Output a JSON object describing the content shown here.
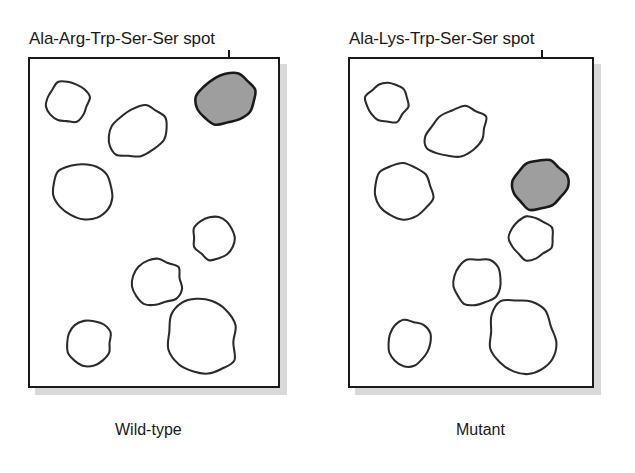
{
  "figure": {
    "title_label_left": "Ala-Arg-Trp-Ser-Ser spot",
    "title_label_right": "Ala-Lys-Trp-Ser-Ser spot",
    "caption_left": "Wild-type",
    "caption_right": "Mutant",
    "background_color": "#ffffff",
    "ink_color": "#1a1a1a",
    "marked_spot_fill": "#9e9e9e",
    "panel_shadow_color": "#d9d9d9"
  },
  "chart_data": {
    "type": "scatter",
    "title": "",
    "xlabel": "",
    "ylabel": "",
    "grid": false,
    "legend": "none",
    "panels": [
      {
        "name": "Wild-type",
        "caption": "Wild-type",
        "annotation": "Ala-Arg-Trp-Ser-Ser spot",
        "box": {
          "x": 28,
          "y": 57,
          "width": 252,
          "height": 331
        },
        "leader_line": {
          "x": 228,
          "y_top": 50,
          "y_bottom": 91
        },
        "spots": [
          {
            "id": "spot-1",
            "cx": 66,
            "cy": 100,
            "rx": 22,
            "ry": 21,
            "rotation": -12,
            "fill": "white",
            "marked": false
          },
          {
            "id": "spot-2",
            "cx": 136,
            "cy": 131,
            "rx": 32,
            "ry": 24,
            "rotation": -28,
            "fill": "white",
            "marked": false
          },
          {
            "id": "spot-3",
            "cx": 228,
            "cy": 97,
            "rx": 30,
            "ry": 26,
            "rotation": -18,
            "fill": "gray",
            "marked": true
          },
          {
            "id": "spot-4",
            "cx": 82,
            "cy": 190,
            "rx": 31,
            "ry": 28,
            "rotation": 14,
            "fill": "white",
            "marked": false
          },
          {
            "id": "spot-5",
            "cx": 215,
            "cy": 238,
            "rx": 22,
            "ry": 22,
            "rotation": 0,
            "fill": "white",
            "marked": false
          },
          {
            "id": "spot-6",
            "cx": 157,
            "cy": 283,
            "rx": 25,
            "ry": 24,
            "rotation": -10,
            "fill": "white",
            "marked": false
          },
          {
            "id": "spot-7",
            "cx": 88,
            "cy": 345,
            "rx": 23,
            "ry": 23,
            "rotation": 0,
            "fill": "white",
            "marked": false
          },
          {
            "id": "spot-8",
            "cx": 203,
            "cy": 339,
            "rx": 34,
            "ry": 40,
            "rotation": -20,
            "fill": "white",
            "marked": false
          }
        ]
      },
      {
        "name": "Mutant",
        "caption": "Mutant",
        "annotation": "Ala-Lys-Trp-Ser-Ser spot",
        "box": {
          "x": 348,
          "y": 57,
          "width": 246,
          "height": 331
        },
        "leader_line": {
          "x": 541,
          "y_top": 50,
          "y_bottom": 166
        },
        "spots": [
          {
            "id": "spot-1",
            "cx": 386,
            "cy": 100,
            "rx": 22,
            "ry": 21,
            "rotation": -12,
            "fill": "white",
            "marked": false
          },
          {
            "id": "spot-2",
            "cx": 456,
            "cy": 131,
            "rx": 32,
            "ry": 24,
            "rotation": -28,
            "fill": "white",
            "marked": false
          },
          {
            "id": "spot-3",
            "cx": 541,
            "cy": 184,
            "rx": 28,
            "ry": 26,
            "rotation": -18,
            "fill": "gray",
            "marked": true
          },
          {
            "id": "spot-4",
            "cx": 402,
            "cy": 190,
            "rx": 31,
            "ry": 28,
            "rotation": 14,
            "fill": "white",
            "marked": false
          },
          {
            "id": "spot-5",
            "cx": 532,
            "cy": 238,
            "rx": 22,
            "ry": 22,
            "rotation": 0,
            "fill": "white",
            "marked": false
          },
          {
            "id": "spot-6",
            "cx": 477,
            "cy": 283,
            "rx": 25,
            "ry": 24,
            "rotation": -10,
            "fill": "white",
            "marked": false
          },
          {
            "id": "spot-7",
            "cx": 408,
            "cy": 345,
            "rx": 23,
            "ry": 23,
            "rotation": 0,
            "fill": "white",
            "marked": false
          },
          {
            "id": "spot-8",
            "cx": 523,
            "cy": 339,
            "rx": 34,
            "ry": 40,
            "rotation": -20,
            "fill": "white",
            "marked": false
          }
        ]
      }
    ]
  }
}
